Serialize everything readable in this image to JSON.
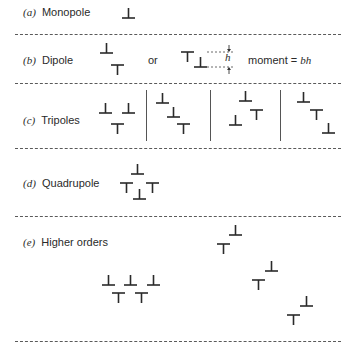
{
  "sections": [
    {
      "id": "a",
      "letter": "(a)",
      "name": "Monopole"
    },
    {
      "id": "b",
      "letter": "(b)",
      "name": "Dipole"
    },
    {
      "id": "c",
      "letter": "(c)",
      "name": "Tripoles"
    },
    {
      "id": "d",
      "letter": "(d)",
      "name": "Quadrupole"
    },
    {
      "id": "e",
      "letter": "(e)",
      "name": "Higher orders"
    }
  ],
  "dipole": {
    "or_text": "or",
    "h_label": "h",
    "moment_text": "moment = ",
    "moment_value": "bh"
  },
  "symbols": {
    "positive_edge": "⊥",
    "negative_edge": "⊤"
  },
  "layout": {
    "dash_color": "#5a5a5a",
    "ink_color": "#2a2a2a"
  }
}
